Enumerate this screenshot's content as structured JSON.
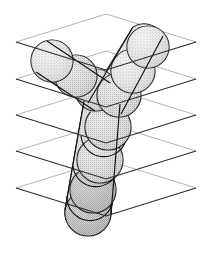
{
  "figure": {
    "title": "Y-branch tubular object represented as a chain of overlapping spheres cut by five parallel slicing planes",
    "canvas": {
      "width": 212,
      "height": 254,
      "background": "#ffffff"
    },
    "colors": {
      "plane_near_edge": "#2b2b2b",
      "plane_far_edge": "#b3b3b3",
      "sphere_outline": "#111111",
      "sphere_fill_light": "#e8e8e8",
      "sphere_fill_mid": "#d2d2d2",
      "sphere_fill_dark": "#b8b8b8",
      "tube_fill": "#dcdcdc",
      "background": "#ffffff"
    },
    "style_notes": {
      "fill_pattern": "halftone-dither-gray",
      "projection": "isometric-oblique",
      "line_style": "aliased-thin-black"
    }
  },
  "planes": {
    "count": 5,
    "label": "parallel slicing planes",
    "shape": "rhombus",
    "vertical_spacing_px": 36.5,
    "geometry": {
      "left_x": 16,
      "right_x": 196,
      "apex_x": 106,
      "half_width": 90,
      "half_height": 28
    },
    "items": [
      {
        "index": 0,
        "name": "plane-1",
        "center_y": 42,
        "top_y": 14,
        "bottom_y": 70
      },
      {
        "index": 1,
        "name": "plane-2",
        "center_y": 79,
        "top_y": 51,
        "bottom_y": 107
      },
      {
        "index": 2,
        "name": "plane-3",
        "center_y": 115,
        "top_y": 87,
        "bottom_y": 143
      },
      {
        "index": 3,
        "name": "plane-4",
        "center_y": 151,
        "top_y": 123,
        "bottom_y": 179
      },
      {
        "index": 4,
        "name": "plane-5",
        "center_y": 188,
        "top_y": 160,
        "bottom_y": 216
      }
    ]
  },
  "object": {
    "name": "y-branch-tube",
    "topology": "bifurcation",
    "branches": [
      {
        "name": "left-branch",
        "sphere_count": 3,
        "direction": "upper-left"
      },
      {
        "name": "right-branch",
        "sphere_count": 3,
        "direction": "upper-right"
      },
      {
        "name": "trunk",
        "sphere_count": 4,
        "direction": "lower"
      }
    ],
    "total_spheres": 9,
    "junction": {
      "x": 103,
      "y": 103
    }
  },
  "spheres": [
    {
      "id": "s-left-1",
      "cx": 52,
      "cy": 61,
      "r": 21,
      "branch": "left-branch",
      "order": 1,
      "shade": "light"
    },
    {
      "id": "s-left-2",
      "cx": 76,
      "cy": 76,
      "r": 21,
      "branch": "left-branch",
      "order": 2,
      "shade": "mid"
    },
    {
      "id": "s-left-3",
      "cx": 96,
      "cy": 90,
      "r": 21,
      "branch": "left-branch",
      "order": 3,
      "shade": "mid"
    },
    {
      "id": "s-right-1",
      "cx": 148,
      "cy": 47,
      "r": 21,
      "branch": "right-branch",
      "order": 1,
      "shade": "light"
    },
    {
      "id": "s-right-2",
      "cx": 133,
      "cy": 71,
      "r": 22,
      "branch": "right-branch",
      "order": 2,
      "shade": "light"
    },
    {
      "id": "s-right-3",
      "cx": 119,
      "cy": 95,
      "r": 22,
      "branch": "right-branch",
      "order": 3,
      "shade": "mid"
    },
    {
      "id": "s-trunk-1",
      "cx": 108,
      "cy": 127,
      "r": 23,
      "branch": "trunk",
      "order": 1,
      "shade": "mid"
    },
    {
      "id": "s-trunk-2",
      "cx": 100,
      "cy": 160,
      "r": 23,
      "branch": "trunk",
      "order": 2,
      "shade": "mid"
    },
    {
      "id": "s-trunk-3",
      "cx": 93,
      "cy": 190,
      "r": 23,
      "branch": "trunk",
      "order": 3,
      "shade": "dark"
    },
    {
      "id": "s-trunk-4",
      "cx": 88,
      "cy": 213,
      "r": 23,
      "branch": "trunk",
      "order": 4,
      "shade": "dark"
    }
  ],
  "legend": {
    "visible": false,
    "entries": []
  },
  "text": {
    "visible_labels": [],
    "note": "no visible text in figure"
  }
}
